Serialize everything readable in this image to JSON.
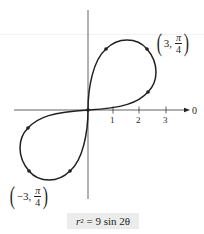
{
  "colors": {
    "ink": "#231f20",
    "formula_bg": "#ececec"
  },
  "diagram": {
    "type": "polar-graph",
    "curve": "lemniscate",
    "axis_label_polar": "0",
    "ticks": [
      "1",
      "2",
      "3"
    ],
    "point_labels": [
      {
        "r": "3",
        "theta_num": "π",
        "theta_den": "4"
      },
      {
        "r": "−3",
        "theta_num": "π",
        "theta_den": "4"
      }
    ],
    "equation": {
      "lhs_var": "r",
      "lhs_exp": "2",
      "rhs": " = 9 sin 2θ"
    }
  }
}
